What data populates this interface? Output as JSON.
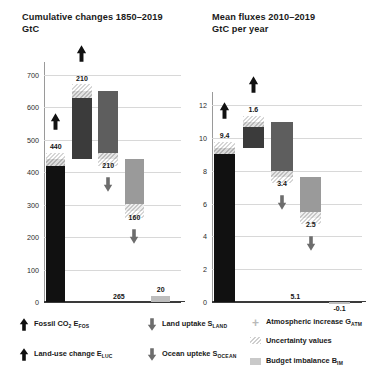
{
  "left": {
    "title": "Cumulative changes 1850–2019\nGtC",
    "unit": "GtC",
    "yticks": [
      0,
      100,
      200,
      300,
      400,
      500,
      600,
      700
    ],
    "ylim": [
      0,
      740
    ],
    "labels": {
      "fossil": "440",
      "luc": "210",
      "land": "210",
      "ocean": "160",
      "ocean_total": "265",
      "imbalance": "20"
    }
  },
  "right": {
    "title": "Mean fluxes 2010–2019\nGtC per year",
    "unit": "GtC per year",
    "yticks": [
      0,
      2,
      4,
      6,
      8,
      10,
      12
    ],
    "ylim": [
      0,
      12.8
    ],
    "labels": {
      "fossil": "9.4",
      "luc": "1.6",
      "land": "3.4",
      "ocean": "2.5",
      "ocean_total": "5.1",
      "imbalance": "-0.1"
    }
  },
  "legend": {
    "items": [
      {
        "icon": "arrow-up-icon",
        "label": "Fossil CO",
        "sub1": "2",
        "label2": " E",
        "sub2": "FOS"
      },
      {
        "icon": "arrow-up-icon",
        "label": "Land-use change E",
        "sub2": "LUC"
      },
      {
        "icon": "arrow-down-icon",
        "label": "Land uptake S",
        "sub2": "LAND"
      },
      {
        "icon": "arrow-down-icon",
        "label": "Ocean upteke S",
        "sub2": "OCEAN"
      },
      {
        "icon": "plus-icon",
        "label": "Atmospheric increase G",
        "sub2": "ATM"
      },
      {
        "icon": "hatch-swatch-icon",
        "label": "Uncertainty values"
      },
      {
        "icon": "gray-swatch-icon",
        "label": "Budget imbalance B",
        "sub2": "IM"
      }
    ]
  },
  "chart_data": [
    {
      "type": "bar",
      "title": "Cumulative changes 1850–2019",
      "subtitle": "GtC",
      "ylabel": "GtC",
      "xlabel": "",
      "ylim": [
        0,
        740
      ],
      "yticks": [
        0,
        100,
        200,
        300,
        400,
        500,
        600,
        700
      ],
      "grid": true,
      "waterfall": true,
      "categories": [
        "Fossil CO2 EFOS",
        "Land-use change ELUC",
        "Land uptake SLAND",
        "Ocean uptake SOCEAN",
        "Budget imbalance BIM"
      ],
      "values": [
        440,
        210,
        -210,
        -160,
        20
      ],
      "cumulative_start": [
        0,
        440,
        650,
        440,
        0
      ],
      "cumulative_end": [
        440,
        650,
        440,
        280,
        20
      ],
      "data_labels": [
        "440",
        "210",
        "210",
        "160",
        "20"
      ],
      "extra_labels": {
        "ocean_cumulative_total": "265"
      },
      "colors": [
        "#111111",
        "#3b3b3b",
        "#5e5e5e",
        "#9a9a9a",
        "#bdbdbd"
      ],
      "directions": [
        "up",
        "up",
        "down",
        "down",
        "none"
      ]
    },
    {
      "type": "bar",
      "title": "Mean fluxes 2010–2019",
      "subtitle": "GtC per year",
      "ylabel": "GtC per year",
      "xlabel": "",
      "ylim": [
        0,
        12.8
      ],
      "yticks": [
        0,
        2,
        4,
        6,
        8,
        10,
        12
      ],
      "grid": true,
      "waterfall": true,
      "categories": [
        "Fossil CO2 EFOS",
        "Land-use change ELUC",
        "Land uptake SLAND",
        "Ocean uptake SOCEAN",
        "Budget imbalance BIM"
      ],
      "values": [
        9.4,
        1.6,
        -3.4,
        -2.5,
        -0.1
      ],
      "cumulative_start": [
        0,
        9.4,
        11.0,
        7.6,
        0
      ],
      "cumulative_end": [
        9.4,
        11.0,
        7.6,
        5.1,
        -0.1
      ],
      "data_labels": [
        "9.4",
        "1.6",
        "3.4",
        "2.5",
        "-0.1"
      ],
      "extra_labels": {
        "ocean_cumulative_total": "5.1"
      },
      "colors": [
        "#111111",
        "#3b3b3b",
        "#5e5e5e",
        "#9a9a9a",
        "#bdbdbd"
      ],
      "directions": [
        "up",
        "up",
        "down",
        "down",
        "none"
      ]
    }
  ]
}
